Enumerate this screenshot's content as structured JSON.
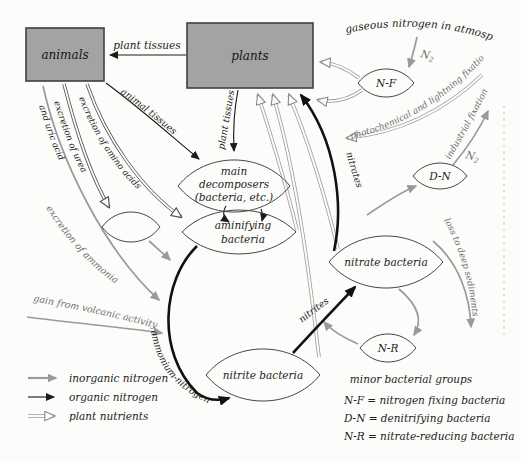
{
  "colors": {
    "background": "#fcfcfa",
    "box_fill": "#a3a3a3",
    "box_border": "#3f3f3f",
    "inorganic_arrow": "#9a9a9a",
    "organic_arrow": "#111111",
    "gray_label": "#6e6e6e"
  },
  "boxes": {
    "animals": "animals",
    "plants": "plants"
  },
  "atmosphere": {
    "label": "gaseous nitrogen in atmosphere"
  },
  "n2a": {
    "base": "N",
    "sub": "2"
  },
  "n2b": {
    "base": "N",
    "sub": "2"
  },
  "pools": {
    "nf": "N-F",
    "dn": "D-N",
    "nr": "N-R",
    "decomposers_l1": "main",
    "decomposers_l2": "decomposers",
    "decomposers_l3": "(bacteria, etc.)",
    "aminifying_l1": "aminifying",
    "aminifying_l2": "bacteria",
    "nitrate": "nitrate bacteria",
    "nitrite": "nitrite bacteria"
  },
  "flows": {
    "plant_tissues_top": "plant tissues",
    "animal_tissues": "animal tissues",
    "plant_tissues_down": "plant tissues",
    "excretion_amino_acids": "excretion of amino acids",
    "excretion_of_urea": "excretion of urea",
    "and_uric_acid": "and uric acid",
    "excretion_of_ammonia": "excretion of ammonia",
    "gain_volcanic": "gain from volcanic activity",
    "ammonium_nitrogen": "ammonium-nitrogen",
    "nitrites": "nitrites",
    "nitrates": "nitrates",
    "photochemical": "photochemical and lightning fixation",
    "industrial": "industrial fixation",
    "loss_sediments": "loss to deep sediments"
  },
  "legend": {
    "inorganic": "inorganic nitrogen",
    "organic": "organic nitrogen",
    "plant": "plant nutrients"
  },
  "key": {
    "title": "minor bacterial groups",
    "entries": [
      "N-F = nitrogen fixing bacteria",
      "D-N = denitrifying bacteria",
      "N-R = nitrate-reducing bacteria"
    ]
  }
}
